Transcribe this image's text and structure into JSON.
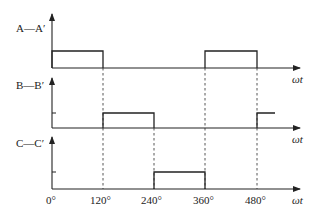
{
  "diagram": {
    "type": "timing-waveform",
    "panels": [
      {
        "label": "A—A′",
        "x_label": "ωt",
        "pulses": [
          [
            0,
            120
          ],
          [
            360,
            480
          ]
        ]
      },
      {
        "label": "B—B′",
        "x_label": "ωt",
        "pulses": [
          [
            120,
            240
          ],
          [
            480,
            520
          ]
        ]
      },
      {
        "label": "C—C′",
        "x_label": "ωt",
        "pulses": [
          [
            240,
            360
          ]
        ]
      }
    ],
    "x_ticks": [
      "0°",
      "120°",
      "240°",
      "360°",
      "480°"
    ],
    "colors": {
      "line": "#222222",
      "dashed": "#444444"
    }
  }
}
